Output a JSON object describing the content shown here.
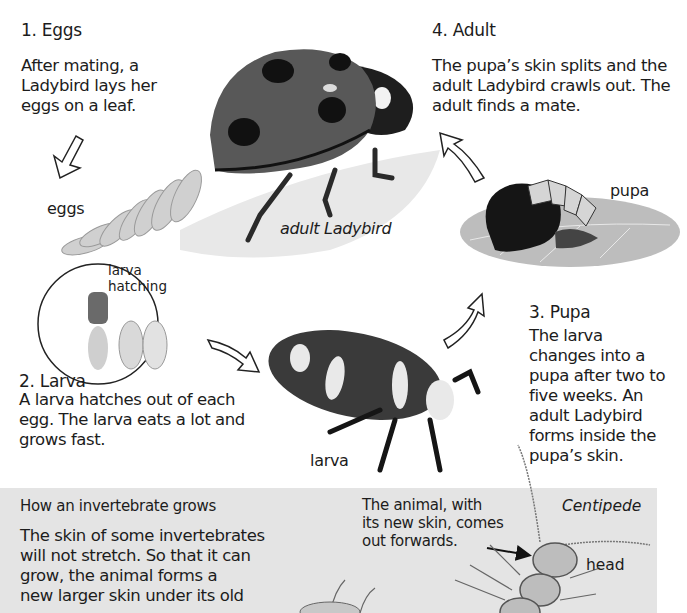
{
  "steps": {
    "eggs": {
      "heading": "1. Eggs",
      "lines": [
        "After mating, a",
        "Ladybird lays her",
        "eggs on a leaf."
      ]
    },
    "adult": {
      "heading": "4. Adult",
      "lines": [
        "The pupa’s skin splits and the",
        "adult Ladybird crawls out. The",
        "adult finds a mate."
      ]
    },
    "larva": {
      "heading": "2. Larva",
      "lines": [
        "A larva hatches out of each",
        "egg. The larva eats a lot and",
        "grows fast."
      ]
    },
    "pupa": {
      "heading": "3. Pupa",
      "lines": [
        "The larva",
        "changes into a",
        "pupa after two to",
        "five weeks. An",
        "adult Ladybird",
        "forms inside the",
        "pupa’s skin."
      ]
    }
  },
  "labels": {
    "eggs": "eggs",
    "adult_ladybird": "adult Ladybird",
    "pupa": "pupa",
    "larva": "larva",
    "larva_hatching": [
      "larva",
      "hatching"
    ]
  },
  "inset": {
    "heading": "How an invertebrate grows",
    "lines": [
      "The skin of some invertebrates",
      "will not stretch. So that it can",
      "grow, the animal forms a",
      "new larger skin under its old"
    ],
    "callout_lines": [
      "The animal, with",
      "its new skin, comes",
      "out forwards."
    ],
    "species_label": "Centipede",
    "head_label": "head"
  },
  "colors": {
    "panel_bg": "#e4e4e4",
    "text": "#1c1c1c",
    "ladybird_shell": "#5a5a5a",
    "spots": "#111111"
  }
}
